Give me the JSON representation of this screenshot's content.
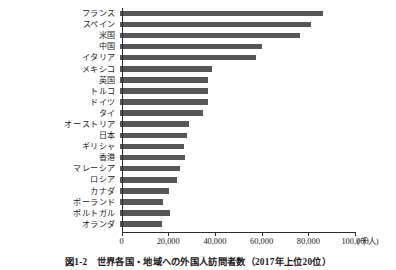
{
  "caption": "図1-2　世界各国・地域への外国人訪問者数（2017年上位20位）",
  "axis": {
    "unit_label": "(千人)",
    "ticks": [
      {
        "value": 0,
        "label": "0"
      },
      {
        "value": 20000,
        "label": "20,000"
      },
      {
        "value": 40000,
        "label": "40,000"
      },
      {
        "value": 60000,
        "label": "60,000"
      },
      {
        "value": 80000,
        "label": "80,000"
      },
      {
        "value": 100000,
        "label": "100,000"
      }
    ]
  },
  "colors": {
    "bar": "#565656",
    "axis": "#2b2b2b",
    "background": "#ffffff",
    "text": "#1a1a1a"
  },
  "chart_data": {
    "type": "bar",
    "orientation": "horizontal",
    "title": "図1-2　世界各国・地域への外国人訪問者数（2017年上位20位）",
    "xlabel": "(千人)",
    "ylabel": "",
    "xlim": [
      0,
      100000
    ],
    "grid": false,
    "legend": "none",
    "xtick_labels": [
      "0",
      "20,000",
      "40,000",
      "60,000",
      "80,000",
      "100,000"
    ],
    "xticks": [
      0,
      20000,
      40000,
      60000,
      80000,
      100000
    ],
    "categories": [
      "フランス",
      "スペイン",
      "米国",
      "中国",
      "イタリア",
      "メキシコ",
      "英国",
      "トルコ",
      "ドイツ",
      "タイ",
      "オーストリア",
      "日本",
      "ギリシャ",
      "香港",
      "マレーシア",
      "ロシア",
      "カナダ",
      "ポーランド",
      "ポルトガル",
      "オランダ"
    ],
    "values": [
      86900,
      81800,
      76900,
      60700,
      58300,
      39300,
      37700,
      37600,
      37500,
      35400,
      29500,
      28700,
      27200,
      27900,
      25900,
      24400,
      20900,
      18300,
      21200,
      17900
    ]
  }
}
